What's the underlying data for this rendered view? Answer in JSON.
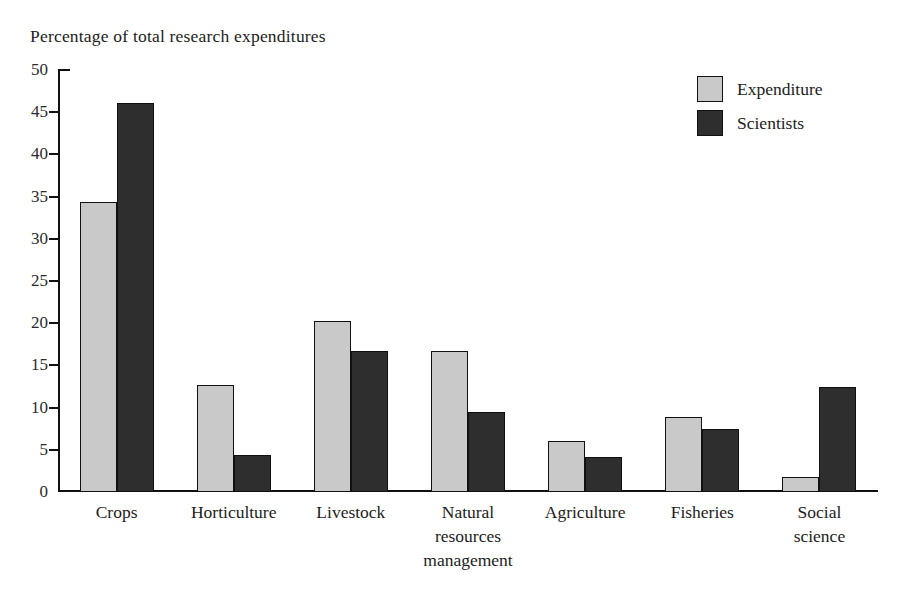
{
  "chart_data": {
    "type": "bar",
    "title": "Percentage of total research expenditures",
    "xlabel": "",
    "ylabel": "",
    "ylim": [
      0,
      50
    ],
    "ytick_step": 5,
    "yticks": [
      "0",
      "5",
      "10",
      "15",
      "20",
      "25",
      "30",
      "35",
      "40",
      "45",
      "50"
    ],
    "grid": false,
    "legend_position": "top-right",
    "categories": [
      "Crops",
      "Horticulture",
      "Livestock",
      "Natural resources management",
      "Agriculture",
      "Fisheries",
      "Social science"
    ],
    "category_lines": [
      [
        "Crops"
      ],
      [
        "Horticulture"
      ],
      [
        "Livestock"
      ],
      [
        "Natural",
        "resources",
        "management"
      ],
      [
        "Agriculture"
      ],
      [
        "Fisheries"
      ],
      [
        "Social",
        "science"
      ]
    ],
    "series": [
      {
        "name": "Expenditure",
        "color": "#c9c9c9",
        "values": [
          34.4,
          12.7,
          20.3,
          16.7,
          6.0,
          8.9,
          1.8
        ]
      },
      {
        "name": "Scientists",
        "color": "#2e2e2e",
        "values": [
          46.1,
          4.4,
          16.7,
          9.5,
          4.1,
          7.5,
          12.5
        ]
      }
    ]
  },
  "legend": {
    "items": [
      {
        "label": "Expenditure",
        "swatch": "light"
      },
      {
        "label": "Scientists",
        "swatch": "dark"
      }
    ]
  },
  "colors": {
    "light_bar": "#c9c9c9",
    "dark_bar": "#2e2e2e",
    "axis": "#111111",
    "background": "#ffffff",
    "text": "#1c1c1c"
  }
}
